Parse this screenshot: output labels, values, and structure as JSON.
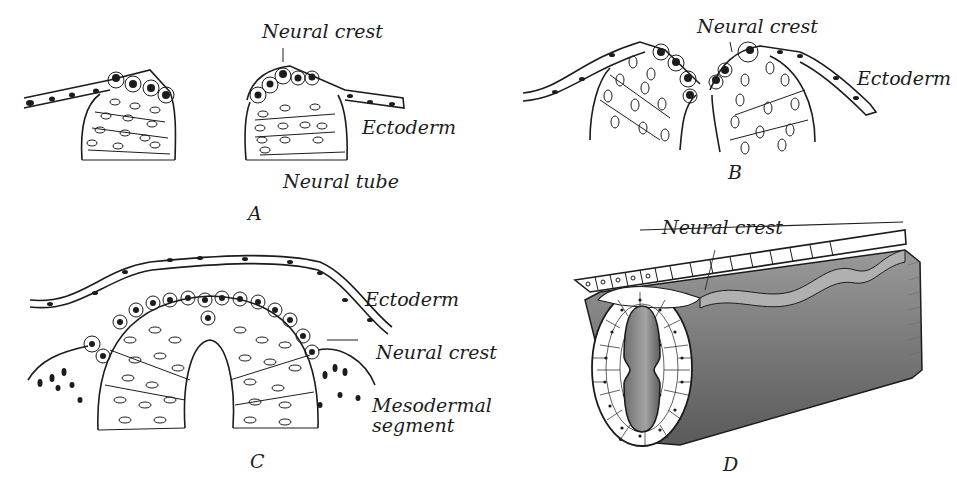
{
  "figure": {
    "panels": [
      {
        "id": "A",
        "letter": "A",
        "labels": {
          "neural_crest": "Neural crest",
          "ectoderm": "Ectoderm",
          "neural_tube": "Neural tube"
        }
      },
      {
        "id": "B",
        "letter": "B",
        "labels": {
          "neural_crest": "Neural crest",
          "ectoderm": "Ectoderm"
        }
      },
      {
        "id": "C",
        "letter": "C",
        "labels": {
          "ectoderm": "Ectoderm",
          "neural_crest": "Neural crest",
          "mesodermal_line1": "Mesodermal",
          "mesodermal_line2": "segment"
        }
      },
      {
        "id": "D",
        "letter": "D",
        "labels": {
          "neural_crest": "Neural crest"
        }
      }
    ],
    "colors": {
      "ink": "#1c1c1c",
      "shade": "#8a8a8a",
      "shade_dark": "#5e5e5e",
      "paper": "#ffffff"
    }
  }
}
